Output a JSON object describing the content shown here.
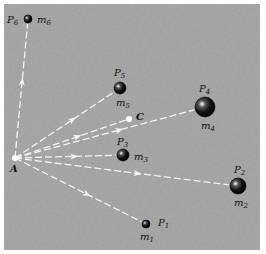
{
  "figure": {
    "background": "#9a9a9a",
    "line_color": "#f2f2f2",
    "origin": {
      "label": "A",
      "x": 15,
      "y": 158
    },
    "center": {
      "label": "C",
      "x": 129,
      "y": 119
    },
    "masses": [
      {
        "point": "P",
        "point_sub": "1",
        "mass": "m",
        "mass_sub": "1",
        "x": 146,
        "y": 224,
        "r": 4
      },
      {
        "point": "P",
        "point_sub": "2",
        "mass": "m",
        "mass_sub": "2",
        "x": 238,
        "y": 186,
        "r": 8
      },
      {
        "point": "P",
        "point_sub": "3",
        "mass": "m",
        "mass_sub": "3",
        "x": 123,
        "y": 155,
        "r": 6
      },
      {
        "point": "P",
        "point_sub": "4",
        "mass": "m",
        "mass_sub": "4",
        "x": 205,
        "y": 107,
        "r": 10
      },
      {
        "point": "P",
        "point_sub": "5",
        "mass": "m",
        "mass_sub": "5",
        "x": 120,
        "y": 88,
        "r": 6
      },
      {
        "point": "P",
        "point_sub": "6",
        "mass": "m",
        "mass_sub": "6",
        "x": 28,
        "y": 19,
        "r": 4
      }
    ]
  }
}
